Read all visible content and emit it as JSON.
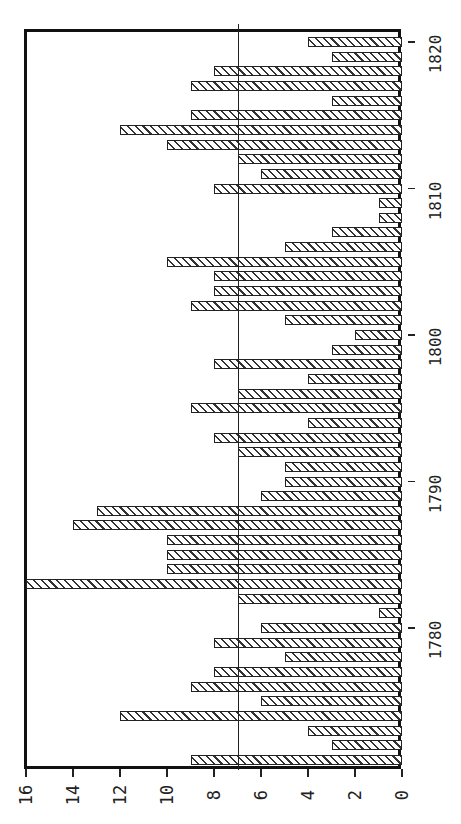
{
  "chart_data": {
    "type": "bar",
    "orientation": "rotated-90-ccw (value axis along bottom, category axis along right side)",
    "title": "",
    "xlabel": "",
    "ylabel": "",
    "categories": [
      1771,
      1772,
      1773,
      1774,
      1775,
      1776,
      1777,
      1778,
      1779,
      1780,
      1781,
      1782,
      1783,
      1784,
      1785,
      1786,
      1787,
      1788,
      1789,
      1790,
      1791,
      1792,
      1793,
      1794,
      1795,
      1796,
      1797,
      1798,
      1799,
      1800,
      1801,
      1802,
      1803,
      1804,
      1805,
      1806,
      1807,
      1808,
      1809,
      1810,
      1811,
      1812,
      1813,
      1814,
      1815,
      1816,
      1817,
      1818,
      1819,
      1820
    ],
    "values": [
      9,
      3,
      4,
      12,
      6,
      9,
      8,
      5,
      8,
      6,
      1,
      7,
      16,
      10,
      10,
      10,
      14,
      13,
      6,
      5,
      5,
      7,
      8,
      4,
      9,
      7,
      4,
      8,
      3,
      2,
      5,
      9,
      8,
      8,
      10,
      5,
      3,
      1,
      1,
      8,
      6,
      7,
      10,
      12,
      9,
      3,
      9,
      8,
      3,
      4
    ],
    "ylim": [
      0,
      16
    ],
    "value_ticks": [
      "0",
      "2",
      "4",
      "6",
      "8",
      "10",
      "12",
      "14",
      "16"
    ],
    "category_ticks": [
      "1780",
      "1790",
      "1800",
      "1810",
      "1820"
    ],
    "reference_line": 7,
    "grid": false,
    "bar_fill": "diagonal hatch",
    "colors": {
      "bar_edge": "#222222",
      "hatch": "#333333",
      "background": "#ffffff",
      "frame": "#111111"
    }
  }
}
